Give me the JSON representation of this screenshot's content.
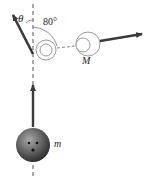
{
  "labels": {
    "theta": "θ",
    "angle": "80°",
    "large_mass": "M",
    "small_mass": "m"
  },
  "colors": {
    "arrow": "#3a3a3a",
    "dashed_line": "#555555",
    "circle_stroke": "#9a9a9a",
    "ball_dark": "#2a2a2a",
    "ball_light": "#9c9c9c"
  }
}
